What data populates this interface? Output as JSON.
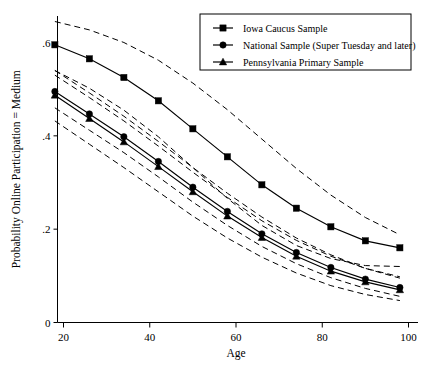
{
  "chart_data": {
    "type": "line",
    "title": "",
    "xlabel": "Age",
    "ylabel": "Probability Online Participation = Medium",
    "xlim": [
      16,
      100
    ],
    "ylim": [
      0,
      0.68
    ],
    "xticks": [
      20,
      40,
      60,
      80,
      100
    ],
    "xticklabels": [
      "20",
      "40",
      "60",
      "80",
      "100"
    ],
    "yticks": [
      0,
      0.2,
      0.4,
      0.6
    ],
    "yticklabels": [
      "0",
      ".2",
      ".4",
      ".6"
    ],
    "grid": false,
    "legend_position": "top-right",
    "x": [
      18,
      26,
      34,
      42,
      50,
      58,
      66,
      74,
      82,
      90,
      98
    ],
    "series": [
      {
        "name": "Iowa Caucus Sample",
        "marker": "square",
        "linestyle": "solid",
        "values": [
          0.595,
          0.565,
          0.525,
          0.475,
          0.415,
          0.355,
          0.295,
          0.245,
          0.205,
          0.175,
          0.16
        ],
        "ci_upper": [
          0.645,
          0.627,
          0.6,
          0.562,
          0.513,
          0.456,
          0.393,
          0.33,
          0.273,
          0.225,
          0.188
        ],
        "ci_lower": [
          0.54,
          0.502,
          0.455,
          0.398,
          0.332,
          0.266,
          0.208,
          0.165,
          0.137,
          0.122,
          0.12
        ]
      },
      {
        "name": "National Sample (Super Tuesday and later)",
        "marker": "circle",
        "linestyle": "solid",
        "values": [
          0.495,
          0.447,
          0.398,
          0.345,
          0.29,
          0.238,
          0.19,
          0.15,
          0.118,
          0.093,
          0.075
        ],
        "ci_upper": [
          0.53,
          0.482,
          0.432,
          0.378,
          0.322,
          0.268,
          0.218,
          0.176,
          0.142,
          0.116,
          0.098
        ],
        "ci_lower": [
          0.46,
          0.412,
          0.364,
          0.312,
          0.258,
          0.208,
          0.163,
          0.126,
          0.096,
          0.073,
          0.056
        ]
      },
      {
        "name": "Pennsylvania Primary Sample",
        "marker": "triangle",
        "linestyle": "solid",
        "values": [
          0.487,
          0.437,
          0.387,
          0.334,
          0.28,
          0.228,
          0.182,
          0.142,
          0.11,
          0.087,
          0.07
        ],
        "ci_upper": [
          0.54,
          0.492,
          0.442,
          0.388,
          0.332,
          0.277,
          0.226,
          0.181,
          0.145,
          0.116,
          0.095
        ],
        "ci_lower": [
          0.432,
          0.382,
          0.332,
          0.28,
          0.228,
          0.181,
          0.14,
          0.106,
          0.079,
          0.06,
          0.047
        ]
      }
    ]
  },
  "legend": {
    "entries": [
      {
        "label": "Iowa Caucus Sample",
        "marker": "square"
      },
      {
        "label": "National Sample (Super Tuesday and later)",
        "marker": "circle"
      },
      {
        "label": "Pennsylvania Primary Sample",
        "marker": "triangle"
      }
    ]
  },
  "axes": {
    "x_title": "Age",
    "y_title": "Probability Online Participation = Medium",
    "x_tick_labels": [
      "20",
      "40",
      "60",
      "80",
      "100"
    ],
    "y_tick_labels": [
      ".6",
      ".4",
      ".2",
      "0"
    ]
  }
}
